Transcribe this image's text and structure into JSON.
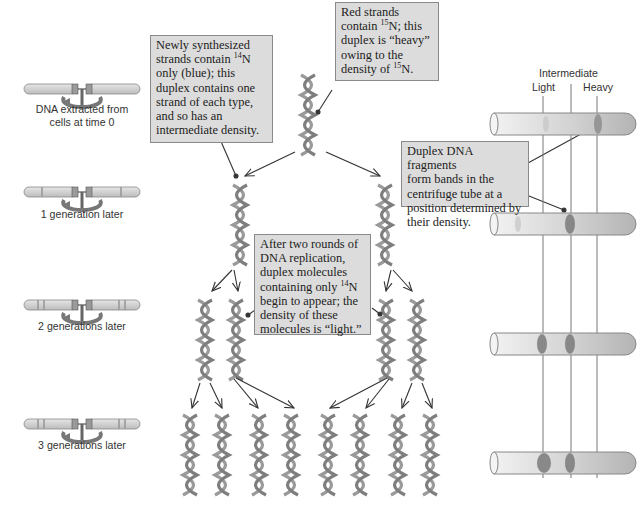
{
  "generations": [
    {
      "label_line1": "DNA extracted from",
      "label_line2": "cells at time 0"
    },
    {
      "label_line1": "1 generation later",
      "label_line2": ""
    },
    {
      "label_line1": "2 generations later",
      "label_line2": ""
    },
    {
      "label_line1": "3 generations later",
      "label_line2": ""
    }
  ],
  "callouts": {
    "heavy": {
      "l1": "Red strands",
      "l2a": "contain ",
      "l2sup": "15",
      "l2b": "N; this",
      "l3": "duplex is “heavy”",
      "l4": "owing to the",
      "l5a": "density of ",
      "l5sup": "15",
      "l5b": "N."
    },
    "intermediate": {
      "l1": "Newly synthesized",
      "l2a": "strands contain ",
      "l2sup": "14",
      "l2b": "N",
      "l3": "only (blue); this",
      "l4": "duplex contains one",
      "l5": "strand of each type,",
      "l6": "and so has an",
      "l7": "intermediate density."
    },
    "bands": {
      "l1": "Duplex DNA fragments",
      "l2": "form bands in the",
      "l3": "centrifuge tube at a",
      "l4": "position determined by",
      "l5": "their density."
    },
    "light": {
      "l1": "After two rounds of",
      "l2": "DNA replication,",
      "l3": "duplex molecules",
      "l4a": "containing only ",
      "l4sup": "14",
      "l4b": "N",
      "l5": "begin to appear; the",
      "l6": "density of these",
      "l7": "molecules is “light.”"
    }
  },
  "density_labels": {
    "intermediate": "Intermediate",
    "light": "Light",
    "heavy": "Heavy"
  },
  "tubes": [
    {
      "generation": 0,
      "bands": [
        "heavy"
      ]
    },
    {
      "generation": 1,
      "bands": [
        "intermediate"
      ]
    },
    {
      "generation": 2,
      "bands": [
        "light",
        "intermediate"
      ]
    },
    {
      "generation": 3,
      "bands": [
        "light",
        "intermediate"
      ]
    }
  ],
  "colors": {
    "callout_bg": "#dcdcdc",
    "callout_border": "#8a8a8a",
    "helix": "#8c8c8c",
    "band": "#7a7a7a",
    "arrow": "#333333"
  }
}
